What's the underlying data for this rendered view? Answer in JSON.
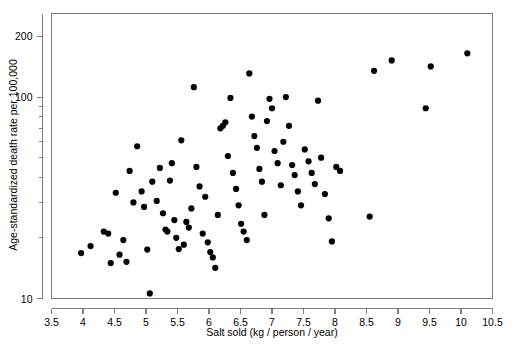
{
  "chart_data": {
    "type": "scatter",
    "title": "",
    "xlabel": "Salt sold (kg / person / year)",
    "ylabel": "Age-standardized death rate per 100,000",
    "xlim": [
      3.5,
      10.5
    ],
    "ylim": [
      10,
      260
    ],
    "yscale": "log",
    "xscale": "linear",
    "grid": false,
    "legend": null,
    "x_ticks": [
      3.5,
      4,
      4.5,
      5,
      5.5,
      6,
      6.5,
      7,
      7.5,
      8,
      8.5,
      9,
      9.5,
      10,
      10.5
    ],
    "x_tick_labels": [
      "3.5",
      "4",
      "4.5",
      "5",
      "5.5",
      "6",
      "6.5",
      "7",
      "7.5",
      "8",
      "8.5",
      "9",
      "9.5",
      "10",
      "10.5"
    ],
    "y_ticks_major": [
      10,
      100,
      200
    ],
    "y_tick_labels": [
      "10",
      "100",
      "200"
    ],
    "y_ticks_minor": [
      20,
      30,
      40,
      50,
      60,
      70,
      80,
      90,
      300
    ],
    "marker": "filled-circle",
    "marker_color": "#000000",
    "marker_size": 3.1,
    "points": [
      {
        "x": 3.97,
        "y": 16.8
      },
      {
        "x": 4.12,
        "y": 18.2
      },
      {
        "x": 4.33,
        "y": 21.5
      },
      {
        "x": 4.4,
        "y": 21.0
      },
      {
        "x": 4.44,
        "y": 15.0
      },
      {
        "x": 4.52,
        "y": 33.5
      },
      {
        "x": 4.58,
        "y": 16.5
      },
      {
        "x": 4.64,
        "y": 19.5
      },
      {
        "x": 4.69,
        "y": 15.2
      },
      {
        "x": 4.74,
        "y": 43.0
      },
      {
        "x": 4.8,
        "y": 30.0
      },
      {
        "x": 4.86,
        "y": 57.0
      },
      {
        "x": 4.93,
        "y": 34.0
      },
      {
        "x": 4.97,
        "y": 28.5
      },
      {
        "x": 5.02,
        "y": 17.5
      },
      {
        "x": 5.06,
        "y": 10.6
      },
      {
        "x": 5.1,
        "y": 38.0
      },
      {
        "x": 5.17,
        "y": 30.5
      },
      {
        "x": 5.22,
        "y": 44.5
      },
      {
        "x": 5.27,
        "y": 26.5
      },
      {
        "x": 5.31,
        "y": 22.0
      },
      {
        "x": 5.34,
        "y": 21.5
      },
      {
        "x": 5.38,
        "y": 38.5
      },
      {
        "x": 5.41,
        "y": 47.0
      },
      {
        "x": 5.45,
        "y": 24.5
      },
      {
        "x": 5.48,
        "y": 20.0
      },
      {
        "x": 5.52,
        "y": 17.6
      },
      {
        "x": 5.56,
        "y": 61.0
      },
      {
        "x": 5.6,
        "y": 18.5
      },
      {
        "x": 5.64,
        "y": 24.0
      },
      {
        "x": 5.68,
        "y": 22.5
      },
      {
        "x": 5.72,
        "y": 28.0
      },
      {
        "x": 5.76,
        "y": 112.0
      },
      {
        "x": 5.8,
        "y": 45.0
      },
      {
        "x": 5.85,
        "y": 36.0
      },
      {
        "x": 5.9,
        "y": 21.0
      },
      {
        "x": 5.94,
        "y": 32.0
      },
      {
        "x": 5.98,
        "y": 19.0
      },
      {
        "x": 6.02,
        "y": 17.0
      },
      {
        "x": 6.06,
        "y": 16.0
      },
      {
        "x": 6.1,
        "y": 14.2
      },
      {
        "x": 6.14,
        "y": 26.0
      },
      {
        "x": 6.18,
        "y": 70.0
      },
      {
        "x": 6.22,
        "y": 72.0
      },
      {
        "x": 6.26,
        "y": 75.0
      },
      {
        "x": 6.3,
        "y": 51.0
      },
      {
        "x": 6.34,
        "y": 99.0
      },
      {
        "x": 6.38,
        "y": 42.0
      },
      {
        "x": 6.43,
        "y": 35.0
      },
      {
        "x": 6.47,
        "y": 29.0
      },
      {
        "x": 6.51,
        "y": 23.5
      },
      {
        "x": 6.55,
        "y": 21.5
      },
      {
        "x": 6.6,
        "y": 19.5
      },
      {
        "x": 6.64,
        "y": 131.0
      },
      {
        "x": 6.68,
        "y": 80.0
      },
      {
        "x": 6.72,
        "y": 64.0
      },
      {
        "x": 6.76,
        "y": 56.0
      },
      {
        "x": 6.8,
        "y": 44.0
      },
      {
        "x": 6.84,
        "y": 38.0
      },
      {
        "x": 6.88,
        "y": 26.0
      },
      {
        "x": 6.92,
        "y": 76.0
      },
      {
        "x": 6.96,
        "y": 98.0
      },
      {
        "x": 7.0,
        "y": 88.0
      },
      {
        "x": 7.04,
        "y": 54.0
      },
      {
        "x": 7.09,
        "y": 47.0
      },
      {
        "x": 7.14,
        "y": 36.5
      },
      {
        "x": 7.18,
        "y": 60.0
      },
      {
        "x": 7.22,
        "y": 100.0
      },
      {
        "x": 7.27,
        "y": 72.0
      },
      {
        "x": 7.32,
        "y": 46.0
      },
      {
        "x": 7.36,
        "y": 41.0
      },
      {
        "x": 7.41,
        "y": 34.0
      },
      {
        "x": 7.46,
        "y": 29.0
      },
      {
        "x": 7.52,
        "y": 55.0
      },
      {
        "x": 7.58,
        "y": 48.0
      },
      {
        "x": 7.63,
        "y": 42.0
      },
      {
        "x": 7.68,
        "y": 37.0
      },
      {
        "x": 7.73,
        "y": 96.0
      },
      {
        "x": 7.78,
        "y": 50.0
      },
      {
        "x": 7.84,
        "y": 33.0
      },
      {
        "x": 7.9,
        "y": 25.0
      },
      {
        "x": 7.95,
        "y": 19.2
      },
      {
        "x": 8.02,
        "y": 45.0
      },
      {
        "x": 8.08,
        "y": 43.0
      },
      {
        "x": 8.55,
        "y": 25.5
      },
      {
        "x": 8.62,
        "y": 135.0
      },
      {
        "x": 8.9,
        "y": 152.0
      },
      {
        "x": 9.44,
        "y": 88.0
      },
      {
        "x": 9.52,
        "y": 142.0
      },
      {
        "x": 10.1,
        "y": 165.0
      }
    ]
  },
  "figure": {
    "background_color": "#ffffff",
    "frame_color": "#808080",
    "point_count": 91
  }
}
